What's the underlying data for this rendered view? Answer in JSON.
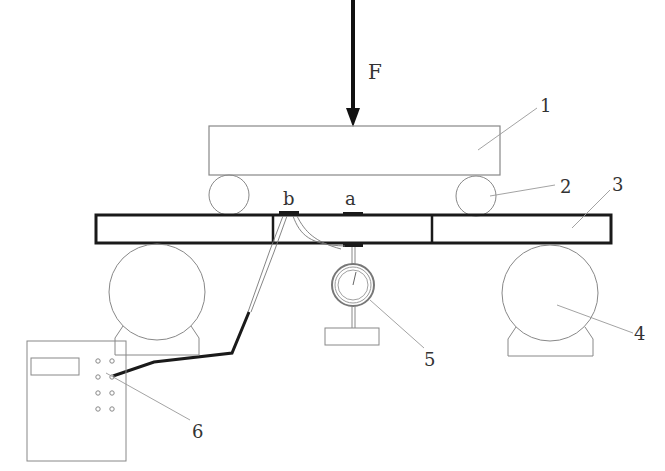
{
  "diagram": {
    "type": "experimental-setup",
    "force": {
      "label": "F"
    },
    "strain_gauges": [
      {
        "label": "b"
      },
      {
        "label": "a"
      }
    ],
    "callouts": [
      {
        "number": "1",
        "component": "loading beam"
      },
      {
        "number": "2",
        "component": "loading roller"
      },
      {
        "number": "3",
        "component": "test beam"
      },
      {
        "number": "4",
        "component": "support roller"
      },
      {
        "number": "5",
        "component": "dial gauge"
      },
      {
        "number": "6",
        "component": "strain indicator"
      }
    ],
    "colors": {
      "line": "#888888",
      "bold_line": "#1a1a1a",
      "text": "#333333",
      "background": "#ffffff"
    }
  }
}
